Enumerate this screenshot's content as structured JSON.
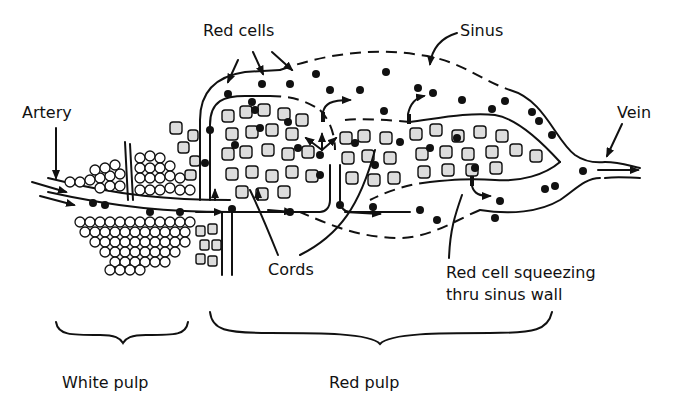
{
  "diagram": {
    "labels": {
      "red_cells": "Red cells",
      "sinus": "Sinus",
      "artery": "Artery",
      "vein": "Vein",
      "cords": "Cords",
      "red_cell_squeezing_line1": "Red cell squeezing",
      "red_cell_squeezing_line2": "thru sinus wall",
      "white_pulp": "White pulp",
      "red_pulp": "Red pulp"
    },
    "colors": {
      "ink": "#111111",
      "background": "#ffffff"
    }
  }
}
